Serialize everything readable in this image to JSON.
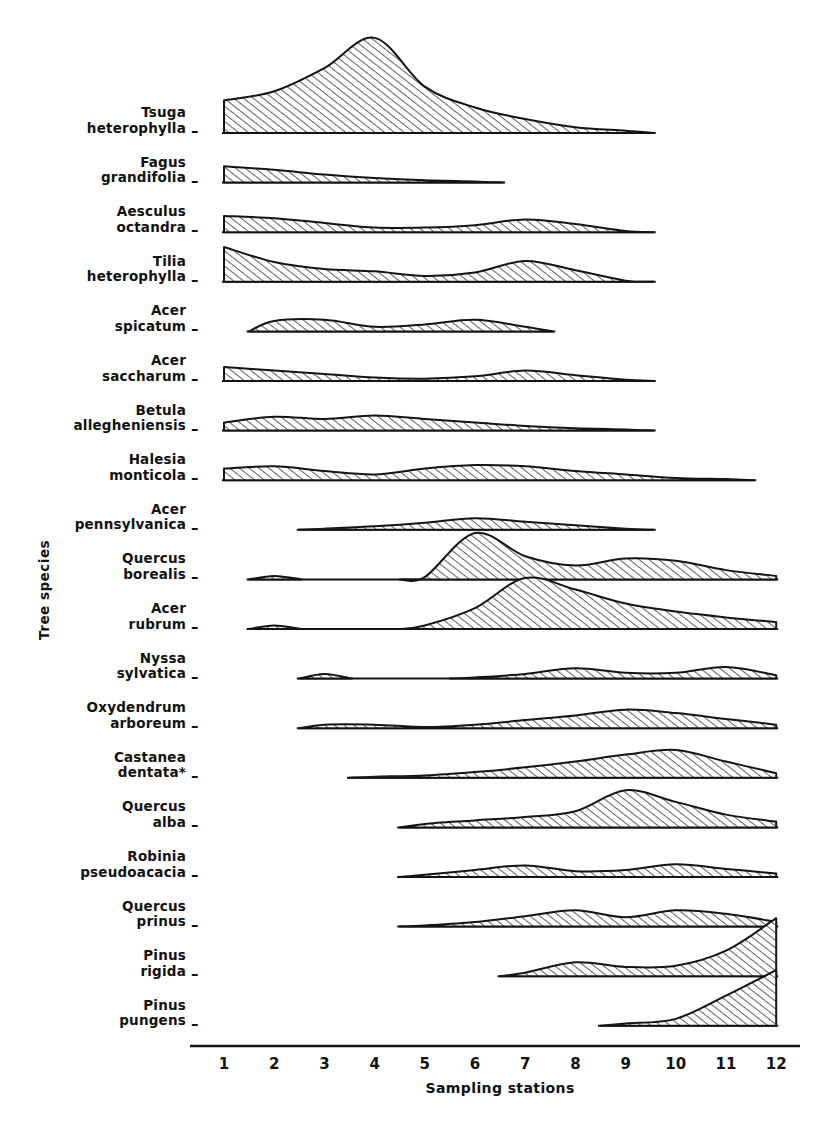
{
  "figure": {
    "xaxis_title": "Sampling stations",
    "yaxis_title": "Tree species",
    "tick_dash": "–",
    "x_ticks": [
      "1",
      "2",
      "3",
      "4",
      "5",
      "6",
      "7",
      "8",
      "9",
      "10",
      "11",
      "12"
    ]
  },
  "species": [
    {
      "genus": "Tsuga",
      "epithet": "heterophylla"
    },
    {
      "genus": "Fagus",
      "epithet": "grandifolia"
    },
    {
      "genus": "Aesculus",
      "epithet": "octandra"
    },
    {
      "genus": "Tilia",
      "epithet": "heterophylla"
    },
    {
      "genus": "Acer",
      "epithet": "spicatum"
    },
    {
      "genus": "Acer",
      "epithet": "saccharum"
    },
    {
      "genus": "Betula",
      "epithet": "allegheniensis"
    },
    {
      "genus": "Halesia",
      "epithet": "monticola"
    },
    {
      "genus": "Acer",
      "epithet": "pennsylvanica"
    },
    {
      "genus": "Quercus",
      "epithet": "borealis"
    },
    {
      "genus": "Acer",
      "epithet": "rubrum"
    },
    {
      "genus": "Nyssa",
      "epithet": "sylvatica"
    },
    {
      "genus": "Oxydendrum",
      "epithet": "arboreum"
    },
    {
      "genus": "Castanea",
      "epithet": "dentata*"
    },
    {
      "genus": "Quercus",
      "epithet": "alba"
    },
    {
      "genus": "Robinia",
      "epithet": "pseudoacacia"
    },
    {
      "genus": "Quercus",
      "epithet": "prinus"
    },
    {
      "genus": "Pinus",
      "epithet": "rigida"
    },
    {
      "genus": "Pinus",
      "epithet": "pungens"
    }
  ],
  "chart_data": {
    "type": "area",
    "title": "",
    "xlabel": "Sampling stations",
    "ylabel": "Tree species",
    "xlim": [
      1,
      12
    ],
    "grid": false,
    "legend": "none",
    "note": "Ridgeline / kite diagram. Each species has its own baseline; values are relative importance (arbitrary units, 0-100) read off the shaded profile heights at each sampling station.",
    "x": [
      1,
      2,
      3,
      4,
      5,
      6,
      7,
      8,
      9,
      10,
      11,
      12
    ],
    "series": [
      {
        "name": "Tsuga heterophylla",
        "values": [
          28,
          36,
          56,
          82,
          40,
          22,
          12,
          5,
          2,
          0,
          0,
          0
        ]
      },
      {
        "name": "Fagus grandifolia",
        "values": [
          14,
          11,
          7,
          4,
          2,
          1,
          0,
          0,
          0,
          0,
          0,
          0
        ]
      },
      {
        "name": "Aesculus octandra",
        "values": [
          14,
          12,
          8,
          4,
          4,
          6,
          11,
          7,
          1,
          0,
          0,
          0
        ]
      },
      {
        "name": "Tilia heterophylla",
        "values": [
          30,
          17,
          11,
          9,
          5,
          8,
          18,
          10,
          1,
          0,
          0,
          0
        ]
      },
      {
        "name": "Acer spicatum",
        "values": [
          0,
          9,
          10,
          4,
          6,
          10,
          4,
          0,
          0,
          0,
          0,
          0
        ]
      },
      {
        "name": "Acer saccharum",
        "values": [
          12,
          9,
          6,
          3,
          2,
          4,
          9,
          5,
          1,
          0,
          0,
          0
        ]
      },
      {
        "name": "Betula allegheniensis",
        "values": [
          7,
          12,
          10,
          13,
          10,
          7,
          4,
          2,
          1,
          0,
          0,
          0
        ]
      },
      {
        "name": "Halesia monticola",
        "values": [
          10,
          12,
          8,
          5,
          10,
          13,
          12,
          8,
          5,
          2,
          1,
          0
        ]
      },
      {
        "name": "Acer pennsylvanica",
        "values": [
          0,
          0,
          1,
          3,
          6,
          10,
          7,
          4,
          1,
          0,
          0,
          0
        ]
      },
      {
        "name": "Quercus borealis",
        "values": [
          0,
          3,
          0,
          0,
          2,
          40,
          20,
          12,
          18,
          16,
          8,
          3
        ]
      },
      {
        "name": "Acer rubrum",
        "values": [
          0,
          3,
          0,
          0,
          3,
          18,
          44,
          34,
          22,
          15,
          10,
          6
        ]
      },
      {
        "name": "Nyssa sylvatica",
        "values": [
          0,
          0,
          4,
          0,
          0,
          1,
          4,
          9,
          5,
          5,
          10,
          3
        ]
      },
      {
        "name": "Oxydendrum arboreum",
        "values": [
          0,
          0,
          3,
          3,
          1,
          3,
          7,
          11,
          16,
          13,
          8,
          3
        ]
      },
      {
        "name": "Castanea dentata*",
        "values": [
          0,
          0,
          0,
          1,
          2,
          5,
          9,
          14,
          20,
          24,
          14,
          4
        ]
      },
      {
        "name": "Quercus alba",
        "values": [
          0,
          0,
          0,
          0,
          3,
          6,
          9,
          14,
          32,
          22,
          11,
          5
        ]
      },
      {
        "name": "Robinia pseudoacacia",
        "values": [
          0,
          0,
          0,
          0,
          2,
          6,
          10,
          5,
          6,
          11,
          7,
          3
        ]
      },
      {
        "name": "Quercus prinus",
        "values": [
          0,
          0,
          0,
          0,
          1,
          4,
          9,
          14,
          8,
          14,
          11,
          4
        ]
      },
      {
        "name": "Pinus rigida",
        "values": [
          0,
          0,
          0,
          0,
          0,
          0,
          3,
          12,
          8,
          9,
          22,
          50
        ]
      },
      {
        "name": "Pinus pungens",
        "values": [
          0,
          0,
          0,
          0,
          0,
          0,
          0,
          0,
          2,
          6,
          26,
          48
        ]
      }
    ]
  }
}
